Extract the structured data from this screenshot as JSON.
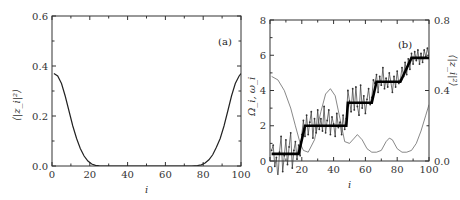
{
  "chart_data": [
    {
      "type": "line",
      "panel": "(a)",
      "xlabel": "i",
      "ylabel": "⟨|z_i|²⟩",
      "xlim": [
        0,
        100
      ],
      "ylim": [
        0,
        0.6
      ],
      "xticks": [
        0,
        20,
        40,
        60,
        80,
        100
      ],
      "yticks": [
        0.0,
        0.2,
        0.4,
        0.6
      ],
      "ytick_labels": [
        "0.0",
        "0.2",
        "0.4",
        "0.6"
      ],
      "series": [
        {
          "name": "⟨|z_i|²⟩",
          "x": [
            1,
            3,
            5,
            7,
            9,
            11,
            13,
            15,
            17,
            19,
            21,
            23,
            25,
            28,
            74,
            77,
            79,
            81,
            83,
            85,
            87,
            89,
            91,
            93,
            95,
            97,
            99,
            100
          ],
          "y": [
            0.37,
            0.36,
            0.33,
            0.28,
            0.22,
            0.16,
            0.11,
            0.07,
            0.04,
            0.02,
            0.008,
            0.003,
            0.001,
            0.0,
            0.0,
            0.002,
            0.005,
            0.012,
            0.025,
            0.045,
            0.075,
            0.11,
            0.16,
            0.22,
            0.28,
            0.33,
            0.36,
            0.37
          ]
        }
      ]
    },
    {
      "type": "line",
      "panel": "(b)",
      "xlabel": "i",
      "ylabel": "Ω_i, ω_i",
      "ylabel_right": "⟨|z_i|²⟩",
      "xlim": [
        0,
        100
      ],
      "ylim": [
        0,
        8
      ],
      "ylim_right": [
        0,
        0.8
      ],
      "xticks": [
        0,
        20,
        40,
        60,
        80,
        100
      ],
      "yticks": [
        0,
        2,
        4,
        6,
        8
      ],
      "yticks_right": [
        0.0,
        0.4,
        0.8
      ],
      "ytick_labels_right": [
        "0.0",
        "0.4",
        "0.8"
      ],
      "series": [
        {
          "name": "Ω_i (step)",
          "axis": "left",
          "x": [
            1,
            18,
            22,
            48,
            49,
            64,
            67,
            82,
            89,
            100
          ],
          "y": [
            0.4,
            0.4,
            2.0,
            2.0,
            3.3,
            3.3,
            4.5,
            4.5,
            5.85,
            5.85
          ]
        },
        {
          "name": "ω_i (noisy)",
          "axis": "left",
          "x": [
            1,
            2,
            3,
            4,
            5,
            6,
            7,
            8,
            9,
            10,
            11,
            12,
            13,
            14,
            15,
            16,
            17,
            18,
            19,
            20,
            21,
            22,
            23,
            24,
            25,
            26,
            27,
            28,
            29,
            30,
            31,
            32,
            33,
            34,
            35,
            36,
            37,
            38,
            39,
            40,
            41,
            42,
            43,
            44,
            45,
            46,
            47,
            48,
            49,
            50,
            51,
            52,
            53,
            54,
            55,
            56,
            57,
            58,
            59,
            60,
            61,
            62,
            63,
            64,
            65,
            66,
            67,
            68,
            69,
            70,
            71,
            72,
            73,
            74,
            75,
            76,
            77,
            78,
            79,
            80,
            81,
            82,
            83,
            84,
            85,
            86,
            87,
            88,
            89,
            90,
            91,
            92,
            93,
            94,
            95,
            96,
            97,
            98,
            99,
            100
          ],
          "y": [
            0.6,
            0.9,
            -0.3,
            0.2,
            -1.0,
            0.5,
            1.4,
            -0.6,
            0.3,
            1.2,
            -0.2,
            0.8,
            1.6,
            -0.4,
            0.6,
            1.1,
            0.1,
            0.9,
            0.3,
            1.5,
            2.3,
            1.4,
            2.6,
            1.5,
            2.2,
            2.8,
            1.3,
            2.4,
            1.6,
            2.9,
            1.8,
            2.4,
            1.7,
            3.1,
            1.6,
            2.3,
            2.9,
            1.5,
            2.5,
            2.1,
            1.4,
            2.7,
            1.9,
            2.2,
            1.5,
            2.6,
            1.8,
            2.4,
            4.0,
            3.4,
            2.8,
            4.1,
            2.9,
            4.2,
            3.1,
            2.6,
            4.3,
            3.0,
            3.7,
            2.7,
            3.5,
            4.1,
            3.2,
            3.6,
            4.6,
            4.4,
            4.9,
            3.9,
            4.8,
            4.3,
            5.3,
            4.1,
            4.7,
            4.2,
            5.0,
            4.5,
            3.9,
            4.8,
            4.2,
            5.1,
            4.4,
            4.6,
            5.3,
            4.8,
            5.6,
            4.9,
            5.8,
            5.2,
            6.1,
            5.5,
            6.2,
            5.7,
            6.3,
            5.5,
            6.1,
            5.6,
            6.3,
            5.9,
            6.4,
            6.0
          ]
        },
        {
          "name": "⟨|z_i|²⟩",
          "axis": "right",
          "x": [
            1,
            5,
            9,
            13,
            16,
            19,
            21,
            24,
            28,
            32,
            35,
            38,
            41,
            44,
            47,
            50,
            53,
            55,
            58,
            61,
            64,
            67,
            70,
            73,
            75,
            77,
            80,
            83,
            86,
            89,
            92,
            95,
            98,
            100
          ],
          "y": [
            0.48,
            0.46,
            0.4,
            0.3,
            0.2,
            0.1,
            0.06,
            0.05,
            0.12,
            0.28,
            0.38,
            0.41,
            0.37,
            0.24,
            0.11,
            0.1,
            0.13,
            0.15,
            0.12,
            0.07,
            0.05,
            0.05,
            0.06,
            0.11,
            0.13,
            0.12,
            0.07,
            0.05,
            0.05,
            0.06,
            0.1,
            0.17,
            0.26,
            0.32
          ]
        }
      ]
    }
  ]
}
